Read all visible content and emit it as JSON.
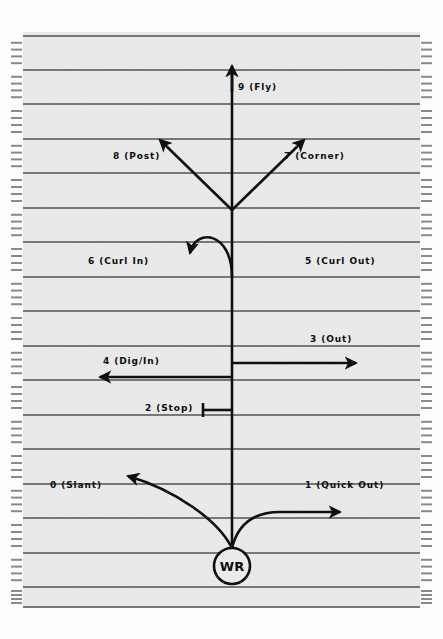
{
  "diagram": {
    "player_marker": {
      "label": "WR",
      "shape": "circle",
      "cx": 232,
      "cy": 566,
      "r": 18
    },
    "field": {
      "background_color": "#ebebeb",
      "yard_line_color": "#787878",
      "hash_mark_color": "#8a8a8a",
      "route_color": "#101010",
      "left_edge": 23,
      "right_edge": 420,
      "top_edge": 32,
      "bottom_edge": 607,
      "yard_line_y": [
        36,
        70,
        104,
        139,
        173,
        208,
        242,
        277,
        311,
        346,
        380,
        415,
        449,
        484,
        518,
        553,
        587,
        607
      ],
      "hash_marks_per_gap": 4
    },
    "routes": [
      {
        "number": "0",
        "name": "Slant",
        "label": "0 (Slant)",
        "side": "left",
        "x": 50,
        "y": 487
      },
      {
        "number": "1",
        "name": "Quick Out",
        "label": "1 (Quick Out)",
        "side": "right",
        "x": 305,
        "y": 487
      },
      {
        "number": "2",
        "name": "Stop",
        "label": "2 (Stop)",
        "side": "left",
        "x": 145,
        "y": 410
      },
      {
        "number": "3",
        "name": "Out",
        "label": "3 (Out)",
        "side": "right",
        "x": 310,
        "y": 341
      },
      {
        "number": "4",
        "name": "Dig/In",
        "label": "4 (Dig/In)",
        "side": "left",
        "x": 103,
        "y": 363
      },
      {
        "number": "5",
        "name": "Curl Out",
        "label": "5 (Curl Out)",
        "side": "right",
        "x": 305,
        "y": 263
      },
      {
        "number": "6",
        "name": "Curl In",
        "label": "6 (Curl In)",
        "side": "left",
        "x": 88,
        "y": 263
      },
      {
        "number": "7",
        "name": "Corner",
        "label": "7 (Corner)",
        "side": "right",
        "x": 284,
        "y": 158
      },
      {
        "number": "8",
        "name": "Post",
        "label": "8 (Post)",
        "side": "left",
        "x": 113,
        "y": 158
      },
      {
        "number": "9",
        "name": "Fly",
        "label": "9 (Fly)",
        "side": "right",
        "x": 238,
        "y": 89
      }
    ]
  }
}
